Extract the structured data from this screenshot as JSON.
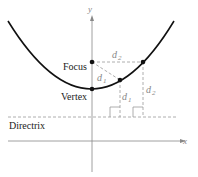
{
  "diagram": {
    "axes": {
      "x_label": "x",
      "y_label": "y"
    },
    "labels": {
      "focus": "Focus",
      "vertex": "Vertex",
      "directrix": "Directrix",
      "d1": "d",
      "d1_sub": "1",
      "d2": "d",
      "d2_sub": "2"
    },
    "colors": {
      "curve": "#111111",
      "guide": "#999999",
      "axis": "#888888"
    }
  }
}
